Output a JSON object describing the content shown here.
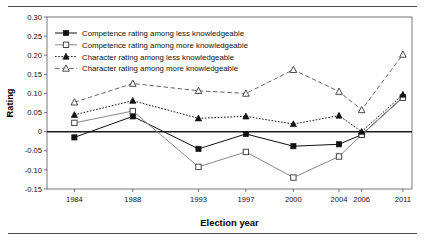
{
  "figure": {
    "has_top_rule": true,
    "has_bottom_rule": true,
    "rule_color": "#4d4d4d"
  },
  "chart_data": {
    "type": "line",
    "title": "",
    "xlabel": "Election year",
    "ylabel": "Rating",
    "categories": [
      "1984",
      "1988",
      "1993",
      "1997",
      "2000",
      "2004",
      "2006",
      "2011"
    ],
    "ylim": [
      -0.15,
      0.3
    ],
    "ytick_labels": [
      "0.30",
      "0.25",
      "0.20",
      "0.15",
      "0.10",
      "0.05",
      "0",
      "-0.05",
      "-0.10",
      "-0.15"
    ],
    "ytick_values": [
      0.3,
      0.25,
      0.2,
      0.15,
      0.1,
      0.05,
      0,
      -0.05,
      -0.1,
      -0.15
    ],
    "grid": false,
    "zero_line": true,
    "legend_position": "top-left",
    "series": [
      {
        "name": "Competence rating among less knowledgeable",
        "marker": "filled-square",
        "line_style": "solid",
        "color": "#111111",
        "values": [
          -0.015,
          0.04,
          -0.045,
          -0.006,
          -0.038,
          -0.033,
          -0.008,
          0.09
        ]
      },
      {
        "name": "Competence rating among more knowledgeable",
        "marker": "open-square",
        "line_style": "solid",
        "color": "#888888",
        "values": [
          0.023,
          0.054,
          -0.092,
          -0.053,
          -0.12,
          -0.065,
          -0.008,
          0.089
        ]
      },
      {
        "name": "Character rating among less knowledgeable",
        "marker": "filled-triangle",
        "line_style": "dotted",
        "color": "#111111",
        "values": [
          0.044,
          0.081,
          0.035,
          0.04,
          0.02,
          0.042,
          0.0,
          0.097
        ]
      },
      {
        "name": "Character rating among more knowledgeable",
        "marker": "open-triangle",
        "line_style": "dashed",
        "color": "#666666",
        "values": [
          0.077,
          0.126,
          0.107,
          0.1,
          0.162,
          0.105,
          0.057,
          0.202
        ]
      }
    ]
  }
}
